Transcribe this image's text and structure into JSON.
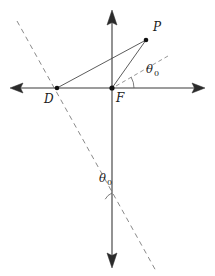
{
  "figure": {
    "background_color": "#ffffff",
    "stroke_color": "#3a3a3a",
    "dashed_color": "#8a8a8a",
    "point_color": "#111111",
    "width": 215,
    "height": 276
  },
  "axes": {
    "horizontal": {
      "name": "x-axis",
      "x1": 10,
      "y1": 88,
      "x2": 205,
      "y2": 88,
      "arrow_left": true,
      "arrow_right": true
    },
    "vertical": {
      "name": "y-axis",
      "x1": 112,
      "y1": 10,
      "x2": 112,
      "y2": 268,
      "arrow_top": true,
      "arrow_bottom": true
    }
  },
  "points": [
    {
      "id": "P",
      "label": "P",
      "x": 146,
      "y": 40,
      "label_x": 153,
      "label_y": 31,
      "dot": true
    },
    {
      "id": "D",
      "label": "D",
      "x": 57,
      "y": 88,
      "label_x": 44,
      "label_y": 102,
      "dot": true
    },
    {
      "id": "F",
      "label": "F",
      "x": 112,
      "y": 88,
      "label_x": 116,
      "label_y": 101,
      "dot": true
    }
  ],
  "segments": [
    {
      "name": "segment-D-to-P",
      "x1": 57,
      "y1": 88,
      "x2": 146,
      "y2": 40
    },
    {
      "name": "segment-F-to-P",
      "x1": 112,
      "y1": 88,
      "x2": 146,
      "y2": 40
    }
  ],
  "dashed_lines": [
    {
      "name": "directrix-dashed-line",
      "x1": 17,
      "y1": 21,
      "x2": 156,
      "y2": 271
    },
    {
      "name": "reference-ray-dashed",
      "x1": 112,
      "y1": 88,
      "x2": 168,
      "y2": 56
    }
  ],
  "angles": [
    {
      "name": "angle-theta-zero-at-focus",
      "label": "θ",
      "subscript": "0",
      "label_x": 148,
      "label_y": 72,
      "vertex_x": 112,
      "vertex_y": 88,
      "radius": 22,
      "start_deg": 0,
      "end_deg": 29.7
    },
    {
      "name": "angle-theta-zero-lower",
      "label": "θ",
      "subscript": "0",
      "label_x": 100,
      "label_y": 181,
      "vertex_x": 119,
      "vertex_y": 205,
      "radius": 14,
      "start_deg": 241,
      "end_deg": 270
    }
  ],
  "labels": {
    "point_p": "P",
    "point_d": "D",
    "point_f": "F",
    "theta_symbol": "θ",
    "theta_subscript": "0"
  }
}
